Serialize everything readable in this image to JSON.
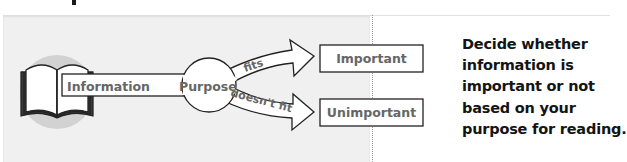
{
  "diagram": {
    "source_icon": "open-book-icon",
    "input_label": "Information",
    "filter_label": "Purpose",
    "branches": [
      {
        "edge_label": "fits",
        "target_label": "Important"
      },
      {
        "edge_label": "doesn't fit",
        "target_label": "Unimportant"
      }
    ]
  },
  "caption": {
    "lines": [
      "Decide whether",
      "information is",
      "important or not",
      "based on your",
      "purpose for reading."
    ]
  },
  "colors": {
    "panel_background": "#f0f0f0",
    "label_text": "#666666",
    "caption_text": "#141414",
    "book_halo": "#cfcfcf",
    "stroke": "#222222"
  }
}
